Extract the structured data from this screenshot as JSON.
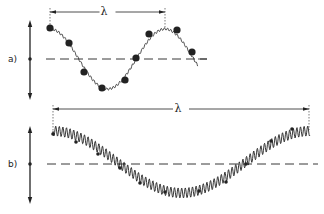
{
  "figure": {
    "panels": [
      {
        "id": "a",
        "label": "a)",
        "wavelength_symbol": "λ",
        "axis_y": 59,
        "dashed_axis": {
          "x1": 46,
          "x2": 207,
          "y": 59
        },
        "amplitude_arrow": {
          "x": 30,
          "y1": 20,
          "y2": 100
        },
        "wavelength_arrow": {
          "x1": 50,
          "x2": 165,
          "y": 12
        },
        "wave": {
          "start_x": 50,
          "end_x": 198,
          "center_y": 59,
          "amplitude": 30,
          "period": 115,
          "phase_start": "crest",
          "ripple_amp": 1.2,
          "ripple_period": 3.2,
          "tail_end_x": 207
        },
        "dots": [
          [
            50,
            28
          ],
          [
            69,
            43
          ],
          [
            84,
            72
          ],
          [
            102,
            88
          ],
          [
            125,
            80
          ],
          [
            136,
            58
          ],
          [
            149,
            34
          ],
          [
            177,
            30
          ],
          [
            192,
            52
          ]
        ]
      },
      {
        "id": "b",
        "label": "b)",
        "wavelength_symbol": "λ",
        "axis_y": 164,
        "dashed_axis": {
          "x1": 47,
          "x2": 318,
          "y": 164
        },
        "amplitude_arrow": {
          "x": 30,
          "y1": 126,
          "y2": 204
        },
        "wavelength_arrow": {
          "x1": 53,
          "x2": 309,
          "y": 109
        },
        "wave": {
          "start_x": 53,
          "end_x": 310,
          "center_y": 162,
          "amplitude": 31,
          "period": 257,
          "phase_start": "crest",
          "ripple_amp": 5,
          "ripple_period": 3.6
        },
        "dots": [
          [
            53,
            134
          ],
          [
            76,
            142
          ],
          [
            98,
            154
          ],
          [
            120,
            168
          ],
          [
            140,
            183
          ],
          [
            165,
            192
          ],
          [
            199,
            191
          ],
          [
            226,
            182
          ],
          [
            246,
            164
          ],
          [
            271,
            141
          ],
          [
            292,
            129
          ]
        ]
      }
    ],
    "colors": {
      "ink": "#222222",
      "background": "#ffffff"
    }
  }
}
